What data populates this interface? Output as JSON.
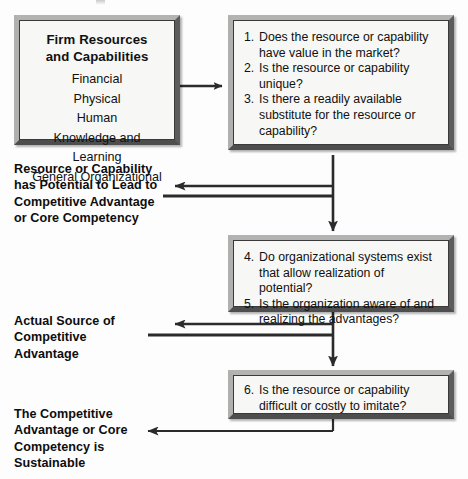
{
  "diagram": {
    "resources_box": {
      "heading_line1": "Firm Resources",
      "heading_line2": "and Capabilities",
      "items": [
        "Financial",
        "Physical",
        "Human",
        "Knowledge and Learning",
        "General Organizational"
      ]
    },
    "question_box_1": {
      "questions": [
        {
          "num": "1.",
          "text": "Does the resource or capability have value in the market?"
        },
        {
          "num": "2.",
          "text": "Is the resource or capability unique?"
        },
        {
          "num": "3.",
          "text": "Is there a readily available substitute for the resource or capability?"
        }
      ]
    },
    "question_box_2": {
      "questions": [
        {
          "num": "4.",
          "text": "Do organizational systems exist that allow realization of potential?"
        },
        {
          "num": "5.",
          "text": "Is the organization aware of and realizing the advantages?"
        }
      ]
    },
    "question_box_3": {
      "questions": [
        {
          "num": "6.",
          "text": "Is the resource or capability difficult or costly to imitate?"
        }
      ]
    },
    "outcomes": [
      {
        "id": "outcome-potential",
        "text": "Resource or Capability has Potential to Lead to Competitive Advantage or Core Competency"
      },
      {
        "id": "outcome-actual-source",
        "text": "Actual Source of Competitive Advantage"
      },
      {
        "id": "outcome-sustainable",
        "text": "The Competitive Advantage or Core Competency is Sustainable"
      }
    ],
    "colors": {
      "line": "#2b2b2b",
      "box_face": "#f7f7f5",
      "box_border_light": "#b3b3b1",
      "box_border_dark": "#4e4e4e",
      "text": "#111111"
    }
  }
}
